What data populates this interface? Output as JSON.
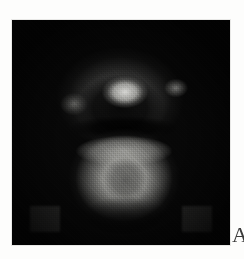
{
  "page": {
    "background_color": "#fdfdfc"
  },
  "scan": {
    "name": "grayscale-scan-image",
    "alt_description": "Low-resolution noisy grayscale scan showing a bright upper square highlight, an arc-shaped halo above it, and a large rounded bright mass below, on a near-black background",
    "background_color": "#070707",
    "bounds": {
      "left": 12,
      "top": 20,
      "width": 218,
      "height": 225
    },
    "features": [
      {
        "name": "outer-halo-arc",
        "label": "Arc-shaped faint halo across upper region",
        "center_x": 108,
        "center_y": 78,
        "intensity": "medium-gray"
      },
      {
        "name": "upper-bright-blob",
        "label": "Bright square highlight",
        "center_x": 113,
        "center_y": 72,
        "intensity": "bright-white"
      },
      {
        "name": "right-highlight-spot",
        "label": "Small highlight on right of arc",
        "center_x": 164,
        "center_y": 68,
        "intensity": "light-gray"
      },
      {
        "name": "left-highlight-spot",
        "label": "Small highlight on left of arc",
        "center_x": 62,
        "center_y": 84,
        "intensity": "dim-gray"
      },
      {
        "name": "dark-separating-band",
        "label": "Dark horizontal band",
        "center_x": 112,
        "center_y": 108,
        "intensity": "black"
      },
      {
        "name": "lower-bright-mass",
        "label": "Large rounded bright mass",
        "center_x": 112,
        "center_y": 158,
        "intensity": "medium-light-gray"
      },
      {
        "name": "lower-inner-core",
        "label": "Darker core inside lower mass",
        "center_x": 113,
        "center_y": 160,
        "intensity": "dark-gray"
      },
      {
        "name": "corner-block-left",
        "label": "Dim square block bottom-left",
        "center_x": 33,
        "center_y": 199,
        "intensity": "dim-gray"
      },
      {
        "name": "corner-block-right",
        "label": "Dim square block bottom-right",
        "center_x": 185,
        "center_y": 199,
        "intensity": "dim-gray"
      }
    ]
  },
  "caption": {
    "partial_letter": "A"
  }
}
